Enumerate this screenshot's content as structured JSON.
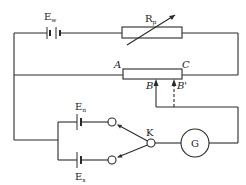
{
  "diagram": {
    "type": "potentiometer-circuit",
    "stroke_color": "#2a2a2a",
    "background": "#ffffff",
    "components": {
      "working_battery": {
        "label": "E",
        "subscript": "w"
      },
      "rheostat": {
        "label": "R",
        "subscript": "p"
      },
      "slide_wire": {
        "end_left": "A",
        "end_right": "C",
        "contact": "B",
        "contact_alt": "B'"
      },
      "standard_cell": {
        "label": "E",
        "subscript": "n"
      },
      "unknown_cell": {
        "label": "E",
        "subscript": "x"
      },
      "switch": {
        "label": "K"
      },
      "galvanometer": {
        "label": "G"
      }
    }
  }
}
